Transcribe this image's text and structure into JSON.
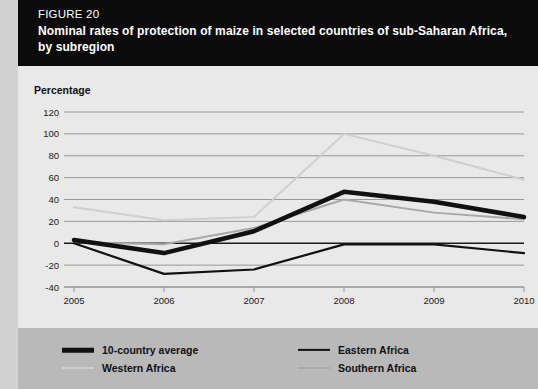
{
  "header": {
    "figure_number": "FIGURE 20",
    "title": "Nominal rates of protection of maize in selected countries of sub-Saharan Africa, by subregion"
  },
  "plot": {
    "y_axis_title": "Percentage"
  },
  "legend": {
    "items": [
      {
        "label": "10-country average",
        "color": "#111111",
        "width": 4.5,
        "column": "left"
      },
      {
        "label": "Western Africa",
        "color": "#cfcfcf",
        "width": 2.0,
        "column": "left"
      },
      {
        "label": "Eastern Africa",
        "color": "#111111",
        "width": 2.2,
        "column": "right"
      },
      {
        "label": "Southern Africa",
        "color": "#a8a8a8",
        "width": 2.0,
        "column": "right"
      }
    ]
  },
  "chart_data": {
    "type": "line",
    "title": "Nominal rates of protection of maize in selected countries of sub-Saharan Africa, by subregion",
    "xlabel": "",
    "ylabel": "Percentage",
    "x": [
      "2005",
      "2006",
      "2007",
      "2008",
      "2009",
      "2010"
    ],
    "xtick_labels": [
      "2005",
      "2006",
      "2007",
      "2008",
      "2009",
      "2010"
    ],
    "ytick_labels": [
      "-40",
      "-20",
      "0",
      "20",
      "40",
      "60",
      "80",
      "100",
      "120"
    ],
    "ylim": [
      -40,
      120
    ],
    "ytick_step": 20,
    "grid": true,
    "legend_position": "bottom",
    "series": [
      {
        "name": "10-country average",
        "color": "#111111",
        "width": 4.5,
        "values": [
          3,
          -9,
          11,
          47,
          38,
          24
        ]
      },
      {
        "name": "Western Africa",
        "color": "#cfcfcf",
        "width": 2.0,
        "values": [
          33,
          21,
          24,
          100,
          80,
          58
        ]
      },
      {
        "name": "Eastern Africa",
        "color": "#111111",
        "width": 2.2,
        "values": [
          0,
          -28,
          -24,
          -1,
          -1,
          -9
        ]
      },
      {
        "name": "Southern Africa",
        "color": "#a8a8a8",
        "width": 2.0,
        "values": [
          1,
          -1,
          14,
          40,
          28,
          22
        ]
      }
    ]
  }
}
